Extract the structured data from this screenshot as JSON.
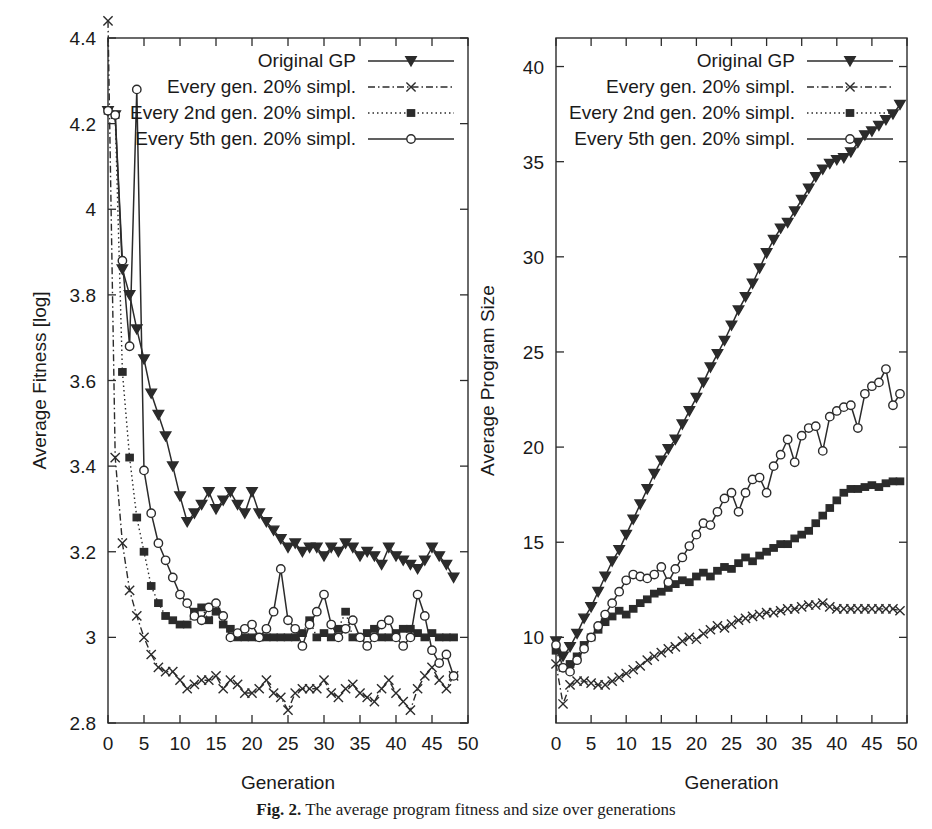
{
  "figure": {
    "caption_label": "Fig. 2.",
    "caption_text": "The average program fitness and size over generations"
  },
  "legend": {
    "entries": [
      {
        "label": "Original GP",
        "marker": "triangle-down-filled",
        "line": "solid"
      },
      {
        "label": "Every gen. 20% simpl.",
        "marker": "cross-x",
        "line": "dash-dot"
      },
      {
        "label": "Every 2nd gen. 20% simpl.",
        "marker": "square-filled",
        "line": "dotted"
      },
      {
        "label": "Every 5th gen. 20% simpl.",
        "marker": "circle-open",
        "line": "solid"
      }
    ]
  },
  "chart_data": [
    {
      "id": "average-fitness",
      "type": "line",
      "title": "",
      "xlabel": "Generation",
      "ylabel": "Average Fitness [log]",
      "xlim": [
        0,
        50
      ],
      "ylim": [
        2.8,
        4.4
      ],
      "xticks": [
        0,
        5,
        10,
        15,
        20,
        25,
        30,
        35,
        40,
        45,
        50
      ],
      "yticks": [
        "2.8",
        "3",
        "3.2",
        "3.4",
        "3.6",
        "3.8",
        "4",
        "4.2",
        "4.4"
      ],
      "grid": false,
      "legend_position": "top-right",
      "x": [
        0,
        1,
        2,
        3,
        4,
        5,
        6,
        7,
        8,
        9,
        10,
        11,
        12,
        13,
        14,
        15,
        16,
        17,
        18,
        19,
        20,
        21,
        22,
        23,
        24,
        25,
        26,
        27,
        28,
        29,
        30,
        31,
        32,
        33,
        34,
        35,
        36,
        37,
        38,
        39,
        40,
        41,
        42,
        43,
        44,
        45,
        46,
        47,
        48
      ],
      "series": [
        {
          "name": "Original GP",
          "marker": "triangle-down-filled",
          "line": "solid",
          "values": [
            4.23,
            4.22,
            3.86,
            3.8,
            3.72,
            3.65,
            3.57,
            3.52,
            3.47,
            3.4,
            3.33,
            3.27,
            3.29,
            3.31,
            3.34,
            3.3,
            3.32,
            3.34,
            3.31,
            3.29,
            3.34,
            3.29,
            3.27,
            3.25,
            3.23,
            3.21,
            3.22,
            3.2,
            3.21,
            3.21,
            3.19,
            3.21,
            3.2,
            3.22,
            3.21,
            3.19,
            3.2,
            3.19,
            3.17,
            3.21,
            3.19,
            3.18,
            3.17,
            3.16,
            3.18,
            3.21,
            3.19,
            3.17,
            3.14
          ]
        },
        {
          "name": "Every gen. 20% simpl.",
          "marker": "cross-x",
          "line": "dash-dot",
          "values": [
            4.44,
            3.42,
            3.22,
            3.11,
            3.05,
            3.0,
            2.96,
            2.93,
            2.92,
            2.92,
            2.9,
            2.88,
            2.89,
            2.9,
            2.9,
            2.91,
            2.88,
            2.9,
            2.89,
            2.87,
            2.87,
            2.88,
            2.9,
            2.87,
            2.86,
            2.83,
            2.87,
            2.88,
            2.88,
            2.88,
            2.9,
            2.87,
            2.86,
            2.88,
            2.89,
            2.87,
            2.86,
            2.85,
            2.88,
            2.9,
            2.87,
            2.85,
            2.83,
            2.88,
            2.91,
            2.93,
            2.9,
            2.88,
            2.91
          ]
        },
        {
          "name": "Every 2nd gen. 20% simpl.",
          "marker": "square-filled",
          "line": "dotted",
          "values": [
            4.23,
            4.22,
            3.62,
            3.42,
            3.28,
            3.2,
            3.12,
            3.08,
            3.05,
            3.04,
            3.03,
            3.03,
            3.06,
            3.07,
            3.04,
            3.06,
            3.03,
            3.02,
            3.0,
            3.0,
            3.0,
            3.0,
            3.0,
            3.0,
            3.0,
            3.0,
            3.0,
            3.01,
            3.04,
            3.0,
            3.01,
            3.0,
            3.02,
            3.06,
            3.0,
            3.0,
            3.01,
            3.02,
            3.0,
            3.0,
            3.01,
            3.02,
            3.02,
            3.01,
            3.0,
            3.01,
            3.0,
            3.0,
            3.0
          ]
        },
        {
          "name": "Every 5th gen. 20% simpl.",
          "marker": "circle-open",
          "line": "solid",
          "values": [
            4.23,
            4.22,
            3.88,
            3.68,
            4.28,
            3.39,
            3.29,
            3.22,
            3.18,
            3.14,
            3.1,
            3.08,
            3.05,
            3.04,
            3.07,
            3.08,
            3.05,
            3.0,
            3.01,
            3.02,
            3.03,
            3.0,
            3.02,
            3.06,
            3.16,
            3.04,
            3.02,
            2.98,
            3.03,
            3.06,
            3.1,
            3.03,
            3.0,
            3.02,
            3.04,
            3.0,
            2.98,
            3.0,
            3.03,
            3.04,
            3.0,
            2.98,
            3.0,
            3.1,
            3.05,
            2.97,
            2.94,
            2.96,
            2.91
          ]
        }
      ]
    },
    {
      "id": "average-program-size",
      "type": "line",
      "title": "",
      "xlabel": "Generation",
      "ylabel": "Average Program Size",
      "xlim": [
        0,
        50
      ],
      "ylim": [
        5.5,
        41.5
      ],
      "xticks": [
        0,
        5,
        10,
        15,
        20,
        25,
        30,
        35,
        40,
        45,
        50
      ],
      "yticks": [
        "10",
        "15",
        "20",
        "25",
        "30",
        "35",
        "40"
      ],
      "grid": false,
      "legend_position": "top-right",
      "x": [
        0,
        1,
        2,
        3,
        4,
        5,
        6,
        7,
        8,
        9,
        10,
        11,
        12,
        13,
        14,
        15,
        16,
        17,
        18,
        19,
        20,
        21,
        22,
        23,
        24,
        25,
        26,
        27,
        28,
        29,
        30,
        31,
        32,
        33,
        34,
        35,
        36,
        37,
        38,
        39,
        40,
        41,
        42,
        43,
        44,
        45,
        46,
        47,
        48,
        49
      ],
      "series": [
        {
          "name": "Original GP",
          "marker": "triangle-down-filled",
          "line": "solid",
          "values": [
            9.8,
            9.0,
            9.5,
            10.2,
            11.0,
            11.6,
            12.4,
            13.2,
            14.0,
            14.6,
            15.4,
            16.2,
            17.0,
            17.8,
            18.6,
            19.3,
            19.9,
            20.4,
            21.2,
            21.9,
            22.6,
            23.4,
            24.2,
            24.9,
            25.6,
            26.4,
            27.2,
            27.9,
            28.6,
            29.4,
            30.2,
            30.9,
            31.5,
            31.8,
            32.4,
            33.0,
            33.6,
            34.2,
            34.6,
            34.9,
            35.1,
            35.2,
            35.5,
            36.0,
            36.4,
            36.6,
            36.9,
            37.2,
            37.5,
            38.0
          ]
        },
        {
          "name": "Every gen. 20% simpl.",
          "marker": "cross-x",
          "line": "dash-dot",
          "values": [
            8.6,
            6.5,
            7.5,
            7.7,
            7.7,
            7.6,
            7.5,
            7.5,
            7.7,
            7.9,
            8.1,
            8.3,
            8.5,
            8.8,
            9.0,
            9.2,
            9.4,
            9.5,
            9.8,
            10.0,
            9.9,
            10.2,
            10.4,
            10.6,
            10.5,
            10.7,
            10.9,
            11.0,
            11.1,
            11.2,
            11.3,
            11.3,
            11.4,
            11.5,
            11.5,
            11.6,
            11.7,
            11.7,
            11.8,
            11.6,
            11.5,
            11.5,
            11.5,
            11.5,
            11.5,
            11.5,
            11.5,
            11.5,
            11.5,
            11.4
          ]
        },
        {
          "name": "Every 2nd gen. 20% simpl.",
          "marker": "square-filled",
          "line": "dotted",
          "values": [
            9.3,
            8.4,
            8.6,
            9.0,
            9.6,
            10.0,
            10.4,
            10.8,
            11.1,
            11.4,
            11.2,
            11.5,
            11.8,
            12.0,
            12.3,
            12.4,
            12.6,
            12.8,
            13.0,
            12.9,
            13.2,
            13.4,
            13.2,
            13.5,
            13.7,
            13.6,
            13.9,
            14.2,
            14.0,
            14.3,
            14.5,
            14.7,
            14.9,
            14.9,
            15.2,
            15.4,
            15.6,
            16.0,
            16.4,
            16.8,
            17.2,
            17.6,
            17.8,
            17.8,
            17.9,
            18.0,
            17.9,
            18.1,
            18.2,
            18.2
          ]
        },
        {
          "name": "Every 5th gen. 20% simpl.",
          "marker": "circle-open",
          "line": "solid",
          "values": [
            9.6,
            8.4,
            8.2,
            8.8,
            9.4,
            10.0,
            10.6,
            11.2,
            11.8,
            12.4,
            13.0,
            13.3,
            13.2,
            13.1,
            13.3,
            13.7,
            12.9,
            13.6,
            14.2,
            14.8,
            15.4,
            16.0,
            15.9,
            16.6,
            17.3,
            17.6,
            16.6,
            17.6,
            18.3,
            18.4,
            17.6,
            19.0,
            19.6,
            20.4,
            19.2,
            20.6,
            21.0,
            21.1,
            19.8,
            21.6,
            21.9,
            22.1,
            22.2,
            21.0,
            22.8,
            23.2,
            23.4,
            24.1,
            22.2,
            22.8
          ]
        }
      ]
    }
  ]
}
